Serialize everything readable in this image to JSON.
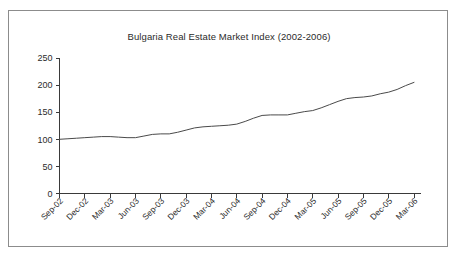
{
  "chart_data": {
    "type": "line",
    "title": "Bulgaria Real Estate Market Index (2002-2006)",
    "xlabel": "",
    "ylabel": "",
    "ylim": [
      0,
      250
    ],
    "y_ticks": [
      0,
      50,
      100,
      150,
      200,
      250
    ],
    "grid": false,
    "legend": "none",
    "x_tick_labels": [
      "Sep-02",
      "Dec-02",
      "Mar-03",
      "Jun-03",
      "Sep-03",
      "Dec-03",
      "Mar-04",
      "Jun-04",
      "Sep-04",
      "Dec-04",
      "Mar-05",
      "Jun-05",
      "Sep-05",
      "Dec-05",
      "Mar-06"
    ],
    "series": [
      {
        "name": "Bulgaria Real Estate Market Index",
        "color": "#4a4a4a",
        "x": [
          "Sep-02",
          "Oct-02",
          "Nov-02",
          "Dec-02",
          "Jan-03",
          "Feb-03",
          "Mar-03",
          "Apr-03",
          "May-03",
          "Jun-03",
          "Jul-03",
          "Aug-03",
          "Sep-03",
          "Oct-03",
          "Nov-03",
          "Dec-03",
          "Jan-04",
          "Feb-04",
          "Mar-04",
          "Apr-04",
          "May-04",
          "Jun-04",
          "Jul-04",
          "Aug-04",
          "Sep-04",
          "Oct-04",
          "Nov-04",
          "Dec-04",
          "Jan-05",
          "Feb-05",
          "Mar-05",
          "Apr-05",
          "May-05",
          "Jun-05",
          "Jul-05",
          "Aug-05",
          "Sep-05",
          "Oct-05",
          "Nov-05",
          "Dec-05",
          "Jan-06",
          "Feb-06",
          "Mar-06"
        ],
        "values": [
          100,
          101,
          102,
          103,
          104,
          105,
          105,
          104,
          103,
          103,
          106,
          109,
          110,
          110,
          113,
          117,
          121,
          123,
          124,
          125,
          126,
          128,
          133,
          139,
          144,
          145,
          145,
          145,
          148,
          151,
          153,
          158,
          164,
          170,
          175,
          177,
          178,
          180,
          184,
          187,
          192,
          199,
          205
        ]
      }
    ]
  },
  "figure": {
    "caption_partial": ""
  }
}
